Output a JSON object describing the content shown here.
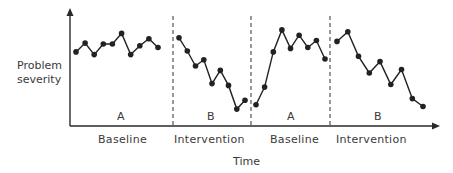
{
  "chart_data": {
    "type": "line",
    "title": "",
    "xlabel": "Time",
    "ylabel": "Problem severity",
    "ylabel_lines": [
      "Problem",
      "severity"
    ],
    "grid": false,
    "legend": null,
    "axis_ticks": false,
    "design": "ABAB reversal design",
    "phases": [
      {
        "letter": "A",
        "name": "Baseline",
        "values": [
          6.6,
          7.6,
          6.3,
          7.5,
          7.5,
          8.7,
          6.3,
          7.3,
          8.1,
          7.1
        ]
      },
      {
        "letter": "B",
        "name": "Intervention",
        "values": [
          8.2,
          6.7,
          5.0,
          5.7,
          3.0,
          4.5,
          2.8,
          0.1,
          1.1
        ]
      },
      {
        "letter": "A",
        "name": "Baseline",
        "values": [
          0.6,
          2.6,
          6.6,
          9.1,
          7.0,
          8.5,
          7.1,
          7.9,
          5.8
        ]
      },
      {
        "letter": "B",
        "name": "Intervention",
        "values": [
          7.8,
          8.9,
          6.1,
          4.2,
          5.5,
          2.9,
          4.6,
          1.3,
          0.4
        ]
      }
    ],
    "y_range": [
      0,
      10
    ],
    "x_axis_arrow": true,
    "y_axis_arrow": true,
    "phase_dividers": "dashed"
  },
  "labels": {
    "y_line1": "Problem",
    "y_line2": "severity",
    "x_axis": "Time",
    "phase_letters": [
      "A",
      "B",
      "A",
      "B"
    ],
    "phase_names": [
      "Baseline",
      "Intervention",
      "Baseline",
      "Intervention"
    ]
  },
  "colors": {
    "line": "#222222",
    "axis": "#2a2a2a",
    "divider": "#555555",
    "text": "#3a3a3a"
  }
}
